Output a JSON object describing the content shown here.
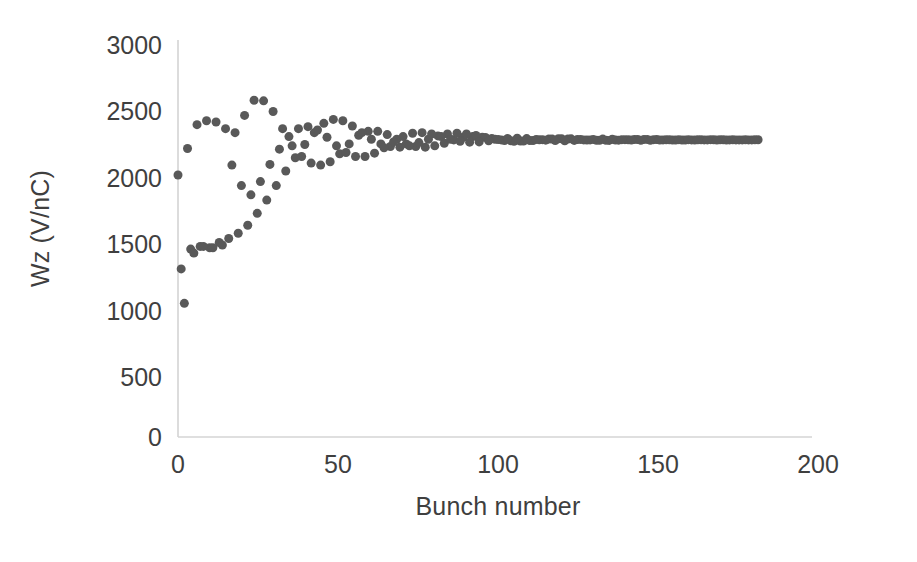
{
  "chart_data": {
    "type": "scatter",
    "title": "",
    "xlabel": "Bunch number",
    "ylabel": "Wz (V/nC)",
    "xlim": [
      0,
      200
    ],
    "ylim": [
      0,
      3000
    ],
    "xticks": [
      0,
      50,
      100,
      150,
      200
    ],
    "yticks": [
      0,
      500,
      1000,
      1500,
      2000,
      2500,
      3000
    ],
    "grid": false,
    "legend": null,
    "marker": {
      "shape": "circle",
      "color": "#595959",
      "size_px": 9
    },
    "converged_value": 2245,
    "series": [
      {
        "name": "branch-a",
        "x": [
          0,
          3,
          6,
          9,
          12,
          15,
          18,
          21,
          24,
          27,
          30,
          33,
          36,
          39,
          42,
          45,
          48,
          51,
          54,
          57,
          60,
          63,
          66,
          69,
          72,
          75,
          78,
          81,
          84,
          87,
          90,
          93,
          96,
          99,
          102,
          105,
          108,
          111,
          114,
          117,
          120,
          123,
          126,
          129,
          132,
          135,
          138,
          141,
          144,
          147,
          150,
          153,
          156,
          159,
          162,
          165,
          168,
          171,
          174,
          177,
          180,
          183
        ],
        "y": [
          1980,
          2180,
          2360,
          2390,
          2380,
          2330,
          2300,
          2430,
          2545,
          2540,
          2460,
          2330,
          2200,
          2120,
          2070,
          2055,
          2080,
          2140,
          2215,
          2280,
          2310,
          2310,
          2285,
          2250,
          2215,
          2195,
          2190,
          2200,
          2220,
          2245,
          2265,
          2270,
          2265,
          2255,
          2245,
          2238,
          2236,
          2240,
          2246,
          2252,
          2254,
          2252,
          2248,
          2244,
          2242,
          2242,
          2244,
          2247,
          2249,
          2249,
          2247,
          2245,
          2244,
          2244,
          2245,
          2246,
          2247,
          2246,
          2245,
          2245,
          2245,
          2246
        ]
      },
      {
        "name": "branch-b",
        "x": [
          1,
          4,
          7,
          10,
          13,
          16,
          19,
          22,
          25,
          28,
          31,
          34,
          37,
          40,
          43,
          46,
          49,
          52,
          55,
          58,
          61,
          64,
          67,
          70,
          73,
          76,
          79,
          82,
          85,
          88,
          91,
          94,
          97,
          100,
          103,
          106,
          109,
          112,
          115,
          118,
          121,
          124,
          127,
          130,
          133,
          136,
          139,
          142,
          145,
          148,
          151,
          154,
          157,
          160,
          163,
          166,
          169,
          172,
          175,
          178,
          181
        ],
        "y": [
          1270,
          1420,
          1440,
          1430,
          1470,
          1500,
          1540,
          1600,
          1690,
          1790,
          1900,
          2010,
          2110,
          2210,
          2300,
          2370,
          2400,
          2390,
          2350,
          2300,
          2250,
          2215,
          2195,
          2190,
          2200,
          2225,
          2250,
          2275,
          2290,
          2295,
          2290,
          2278,
          2264,
          2250,
          2240,
          2235,
          2236,
          2240,
          2247,
          2252,
          2254,
          2253,
          2249,
          2245,
          2242,
          2241,
          2243,
          2246,
          2248,
          2249,
          2248,
          2246,
          2244,
          2244,
          2244,
          2245,
          2246,
          2246,
          2246,
          2245,
          2245
        ]
      },
      {
        "name": "branch-c",
        "x": [
          2,
          5,
          8,
          11,
          14,
          17,
          20,
          23,
          26,
          29,
          32,
          35,
          38,
          41,
          44,
          47,
          50,
          53,
          56,
          59,
          62,
          65,
          68,
          71,
          74,
          77,
          80,
          83,
          86,
          89,
          92,
          95,
          98,
          101,
          104,
          107,
          110,
          113,
          116,
          119,
          122,
          125,
          128,
          131,
          134,
          137,
          140,
          143,
          146,
          149,
          152,
          155,
          158,
          161,
          164,
          167,
          170,
          173,
          176,
          179,
          182
        ],
        "y": [
          1010,
          1390,
          1440,
          1430,
          1450,
          2055,
          1900,
          1830,
          1930,
          2060,
          2175,
          2270,
          2330,
          2345,
          2320,
          2265,
          2200,
          2150,
          2120,
          2120,
          2145,
          2185,
          2230,
          2270,
          2295,
          2300,
          2290,
          2270,
          2250,
          2235,
          2228,
          2230,
          2238,
          2248,
          2256,
          2258,
          2255,
          2249,
          2243,
          2240,
          2239,
          2241,
          2245,
          2249,
          2251,
          2250,
          2247,
          2244,
          2242,
          2242,
          2244,
          2246,
          2247,
          2247,
          2246,
          2245,
          2244,
          2244,
          2245,
          2246,
          2246
        ]
      }
    ]
  },
  "axes": {
    "ylabel": "Wz (V/nC)",
    "xlabel": "Bunch number",
    "ytick_labels": [
      "3000",
      "2500",
      "2000",
      "1500",
      "1000",
      "500",
      "0"
    ],
    "xtick_labels": [
      "0",
      "50",
      "100",
      "150",
      "200"
    ],
    "axis_color": "#d4d4d4",
    "tick_color": "#3f3f3f"
  }
}
